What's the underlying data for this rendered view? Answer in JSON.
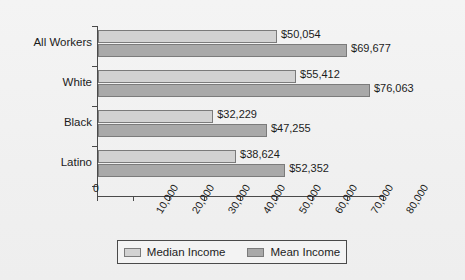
{
  "chart_data": {
    "type": "bar",
    "orientation": "horizontal",
    "title": "",
    "xlabel": "",
    "ylabel": "",
    "categories": [
      "All Workers",
      "White",
      "Black",
      "Latino"
    ],
    "series": [
      {
        "name": "Median Income",
        "color": "#d2d2d2",
        "values": [
          50054,
          55412,
          32229,
          38624
        ],
        "labels": [
          "$50,054",
          "$55,412",
          "$32,229",
          "$38,624"
        ]
      },
      {
        "name": "Mean Income",
        "color": "#a9a9a9",
        "values": [
          69677,
          76063,
          47255,
          52352
        ],
        "labels": [
          "$69,677",
          "$76,063",
          "$47,255",
          "$52,352"
        ]
      }
    ],
    "xlim": [
      0,
      80000
    ],
    "xticks": [
      0,
      10000,
      20000,
      30000,
      40000,
      50000,
      60000,
      70000,
      80000
    ],
    "xtick_labels": [
      "0",
      "10,000",
      "20,000",
      "30,000",
      "40,000",
      "50,000",
      "60,000",
      "70,000",
      "80,000"
    ],
    "grid": false,
    "legend_position": "bottom"
  },
  "legend": {
    "entries": [
      {
        "label": "Median Income"
      },
      {
        "label": "Mean Income"
      }
    ]
  },
  "colors": {
    "background": "#f2f2f2",
    "axis": "#4a4a4a",
    "text": "#1c1c1c",
    "median_bar": "#d2d2d2",
    "mean_bar": "#a9a9a9",
    "bar_border": "#7b7b7b"
  }
}
